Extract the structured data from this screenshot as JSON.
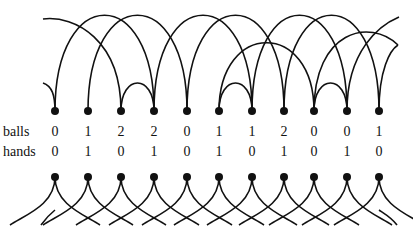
{
  "diagram": {
    "row_labels": {
      "balls": "balls",
      "hands": "hands"
    },
    "balls": [
      "0",
      "1",
      "2",
      "2",
      "0",
      "1",
      "1",
      "2",
      "0",
      "0",
      "1"
    ],
    "hands": [
      "0",
      "1",
      "0",
      "1",
      "0",
      "1",
      "0",
      "1",
      "0",
      "1",
      "0"
    ],
    "dot_x": [
      55,
      88,
      121,
      154,
      187,
      219,
      252,
      284,
      314,
      347,
      379
    ],
    "top_dot_y": 111,
    "bottom_dot_y": 177,
    "stroke_color": "#111111"
  }
}
